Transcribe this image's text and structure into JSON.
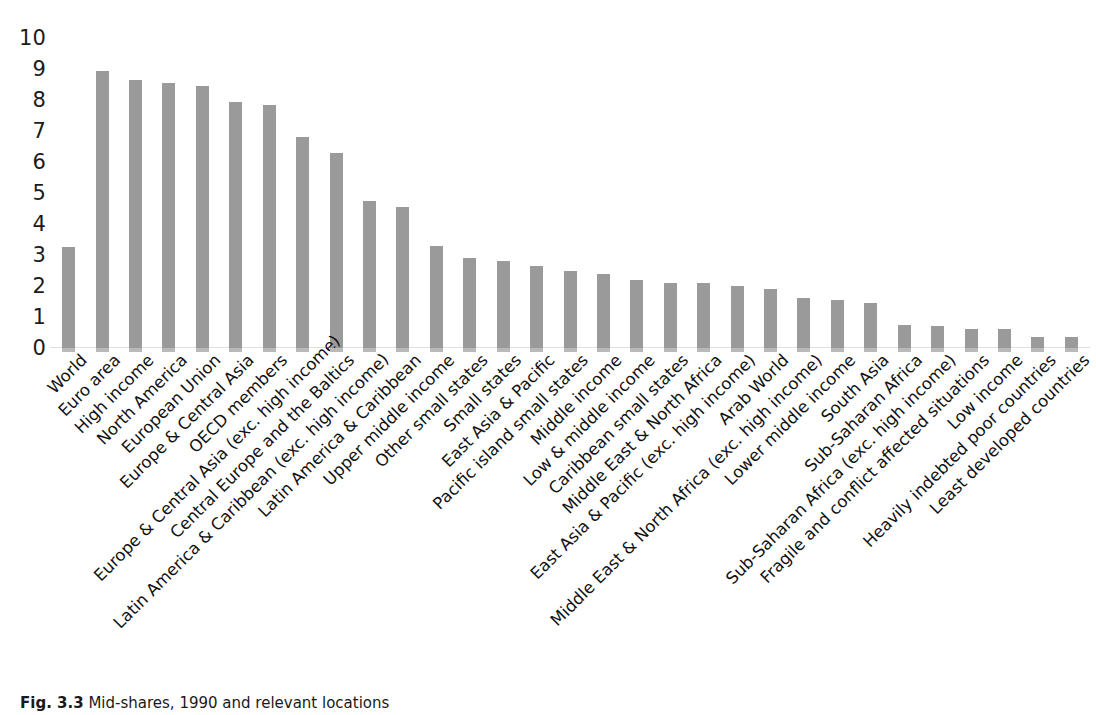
{
  "chart_data": {
    "type": "bar",
    "title": "",
    "subtitle": "",
    "xlabel": "",
    "ylabel": "",
    "ylim": [
      0,
      10
    ],
    "ytick_labels": [
      "10",
      "9",
      "8",
      "7",
      "6",
      "5",
      "4",
      "3",
      "2",
      "1",
      "0"
    ],
    "ytick_values": [
      10,
      9,
      8,
      7,
      6,
      5,
      4,
      3,
      2,
      1,
      0
    ],
    "grid": false,
    "legend": null,
    "bar_color": "#9a9a9a",
    "background_color": "#ffffff",
    "categories": [
      "World",
      "Euro area",
      "High income",
      "North America",
      "European Union",
      "Europe & Central Asia",
      "OECD members",
      "Europe & Central Asia (exc. high income)",
      "Central Europe and the Baltics",
      "Latin America & Caribbean (exc. high income)",
      "Latin America & Caribbean",
      "Upper middle income",
      "Other small states",
      "Small states",
      "East Asia & Pacific",
      "Pacific island small states",
      "Middle income",
      "Low & middle income",
      "Caribbean small states",
      "Middle East & North Africa",
      "East Asia & Pacific (exc. high income)",
      "Arab World",
      "Middle East & North Africa (exc. high income)",
      "Lower middle income",
      "South Asia",
      "Sub-Saharan Africa",
      "Sub-Saharan Africa (exc. high income)",
      "Fragile and conflict affected situations",
      "Low income",
      "Heavily indebted poor countries",
      "Least developed countries"
    ],
    "values": [
      3.25,
      8.95,
      8.65,
      8.55,
      8.45,
      7.95,
      7.85,
      6.8,
      6.3,
      4.75,
      4.55,
      3.3,
      2.9,
      2.8,
      2.65,
      2.5,
      2.4,
      2.2,
      2.1,
      2.1,
      2.0,
      1.9,
      1.6,
      1.55,
      1.45,
      0.75,
      0.7,
      0.6,
      0.6,
      0.35,
      0.35
    ]
  },
  "caption": {
    "figure_number": "Fig. 3.3",
    "text": "Mid-shares, 1990 and relevant locations"
  }
}
